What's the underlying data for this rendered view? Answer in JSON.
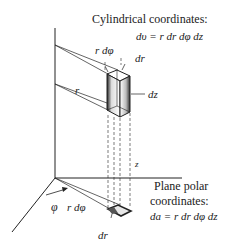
{
  "diagram": {
    "cylindrical": {
      "title": "Cylindrical coordinates:",
      "formula": "dυ = r dr dφ dz"
    },
    "plane_polar": {
      "title_line1": "Plane polar",
      "title_line2": "coordinates:",
      "formula": "da = r dr dφ dz"
    },
    "labels": {
      "r_dphi_top": "r dφ",
      "dr_top": "dr",
      "dz": "dz",
      "r": "r",
      "z": "z",
      "phi": "φ",
      "r_dphi_bottom": "r dφ",
      "dr_bottom": "dr"
    },
    "colors": {
      "line": "#222222",
      "background": "#ffffff"
    }
  }
}
